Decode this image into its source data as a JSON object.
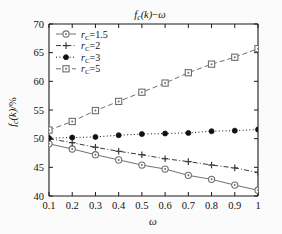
{
  "chart_data": {
    "type": "line",
    "title_display": "f",
    "xlabel": "ω",
    "ylabel": "f_c(k)/%",
    "x": [
      0.1,
      0.2,
      0.3,
      0.4,
      0.5,
      0.6,
      0.7,
      0.8,
      0.9,
      1.0
    ],
    "xtick_labels": [
      "0.1",
      "0.2",
      "0.3",
      "0.4",
      "0.5",
      "0.6",
      "0.7",
      "0.8",
      "0.9",
      "1"
    ],
    "ytick_labels": [
      "40",
      "45",
      "50",
      "55",
      "60",
      "65",
      "70"
    ],
    "yticks": [
      40,
      45,
      50,
      55,
      60,
      65,
      70
    ],
    "xlim": [
      0.1,
      1.0
    ],
    "ylim": [
      40,
      70
    ],
    "grid": false,
    "legend_position": "top-left",
    "series": [
      {
        "name": "r_C=1.5",
        "legend_label": "=1.5",
        "marker": "open-circle",
        "linestyle": "solid",
        "color": "#707070",
        "values": [
          49.1,
          48.2,
          47.2,
          46.3,
          45.4,
          44.7,
          43.6,
          42.9,
          41.9,
          41.0
        ]
      },
      {
        "name": "r_C=2",
        "legend_label": "=2",
        "marker": "plus",
        "linestyle": "dashdot",
        "color": "#3a3a3a",
        "values": [
          50.0,
          49.3,
          48.5,
          47.8,
          47.2,
          46.5,
          46.0,
          45.4,
          44.9,
          44.1
        ]
      },
      {
        "name": "r_C=3",
        "legend_label": "=3",
        "marker": "filled-circle",
        "linestyle": "dotted",
        "color": "#111111",
        "values": [
          50.1,
          50.2,
          50.3,
          50.6,
          50.8,
          50.9,
          51.0,
          51.3,
          51.4,
          51.6
        ]
      },
      {
        "name": "r_C=5",
        "legend_label": "=5",
        "marker": "open-square",
        "linestyle": "dashed",
        "color": "#6e6e6e",
        "values": [
          51.5,
          53.0,
          54.9,
          56.5,
          58.1,
          59.7,
          61.5,
          63.0,
          64.2,
          65.7
        ]
      }
    ]
  },
  "axes": {
    "y_label_main": "f",
    "y_label_sub": "c",
    "y_label_tail": "(k)/%",
    "x_label": "ω"
  },
  "legend": {
    "symbol_r": "r",
    "symbol_sub": "C"
  }
}
